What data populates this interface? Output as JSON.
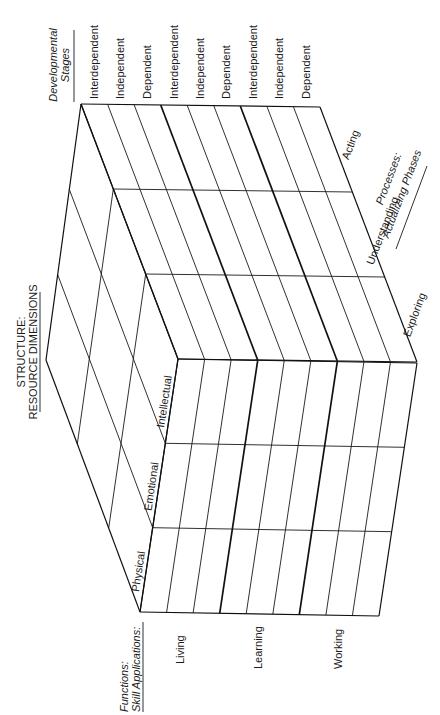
{
  "title": {
    "line1": "STRUCTURE:",
    "line2": "RESOURCE DIMENSIONS"
  },
  "axes": {
    "developmental_stages": {
      "heading_line1": "Developmental",
      "heading_line2": "Stages",
      "labels": [
        "Interdependent",
        "Independent",
        "Dependent",
        "Interdependent",
        "Independent",
        "Dependent",
        "Interdependent",
        "Independent",
        "Dependent"
      ]
    },
    "resource_dimensions": {
      "labels": [
        "Intellectual",
        "Emotional",
        "Physical"
      ]
    },
    "processes": {
      "heading_line1": "Processes:",
      "heading_line2": "Actualizing Phases",
      "labels": [
        "Acting",
        "Understanding",
        "Exploring"
      ]
    },
    "functions": {
      "heading_line1": "Functions:",
      "heading_line2": "Skill Applications:",
      "labels": [
        "Living",
        "Learning",
        "Working"
      ]
    }
  },
  "colors": {
    "line": "#1a1a1a",
    "background": "#ffffff"
  }
}
